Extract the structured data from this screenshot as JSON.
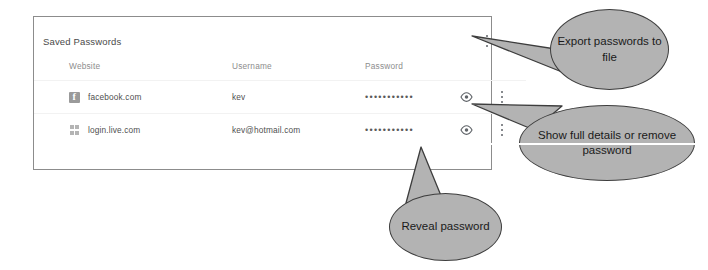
{
  "panel": {
    "title": "Saved Passwords",
    "overflow_menu_icon": "three-dot-menu-icon",
    "columns": {
      "website": "Website",
      "username": "Username",
      "password": "Password"
    },
    "rows": [
      {
        "favicon": "facebook-favicon",
        "website": "facebook.com",
        "username": "kev",
        "password_mask": "•••••••••••",
        "reveal_icon": "eye-icon",
        "row_menu_icon": "three-dot-menu-icon"
      },
      {
        "favicon": "windows-favicon",
        "website": "login.live.com",
        "username": "kev@hotmail.com",
        "password_mask": "•••••••••••",
        "reveal_icon": "eye-icon",
        "row_menu_icon": "three-dot-menu-icon"
      }
    ]
  },
  "annotations": {
    "export": "Export passwords to file",
    "details": "Show full details or remove password",
    "reveal": "Reveal password"
  },
  "colors": {
    "callout_fill": "#b3b3b3",
    "callout_stroke": "#3d3d3d",
    "panel_border": "#8c8c8c",
    "text": "#4f4f4f"
  }
}
